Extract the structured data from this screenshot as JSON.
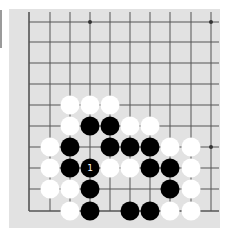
{
  "board": {
    "background": "#e2e2e2",
    "line_color": "#555555",
    "columns_x": [
      29,
      50,
      70,
      90,
      110,
      130,
      150,
      170,
      191,
      211
    ],
    "rows_y": [
      22,
      42,
      63,
      84,
      105,
      126,
      147,
      168,
      189,
      211
    ],
    "edges": {
      "left": true,
      "bottom": true,
      "top": false,
      "right": false
    },
    "star_points": [
      {
        "col": 3,
        "row": 0
      },
      {
        "col": 9,
        "row": 0
      },
      {
        "col": 9,
        "row": 6
      }
    ],
    "stones": [
      {
        "col": 2,
        "row": 4,
        "color": "white"
      },
      {
        "col": 3,
        "row": 4,
        "color": "white"
      },
      {
        "col": 4,
        "row": 4,
        "color": "white"
      },
      {
        "col": 2,
        "row": 5,
        "color": "white"
      },
      {
        "col": 3,
        "row": 5,
        "color": "black"
      },
      {
        "col": 4,
        "row": 5,
        "color": "black"
      },
      {
        "col": 5,
        "row": 5,
        "color": "white"
      },
      {
        "col": 6,
        "row": 5,
        "color": "white"
      },
      {
        "col": 1,
        "row": 6,
        "color": "white"
      },
      {
        "col": 2,
        "row": 6,
        "color": "black"
      },
      {
        "col": 4,
        "row": 6,
        "color": "black"
      },
      {
        "col": 5,
        "row": 6,
        "color": "black"
      },
      {
        "col": 6,
        "row": 6,
        "color": "black"
      },
      {
        "col": 7,
        "row": 6,
        "color": "white"
      },
      {
        "col": 8,
        "row": 6,
        "color": "white"
      },
      {
        "col": 1,
        "row": 7,
        "color": "white"
      },
      {
        "col": 2,
        "row": 7,
        "color": "black"
      },
      {
        "col": 3,
        "row": 7,
        "color": "black",
        "label": "1"
      },
      {
        "col": 4,
        "row": 7,
        "color": "white"
      },
      {
        "col": 5,
        "row": 7,
        "color": "white"
      },
      {
        "col": 6,
        "row": 7,
        "color": "black"
      },
      {
        "col": 7,
        "row": 7,
        "color": "black"
      },
      {
        "col": 8,
        "row": 7,
        "color": "white"
      },
      {
        "col": 1,
        "row": 8,
        "color": "white"
      },
      {
        "col": 2,
        "row": 8,
        "color": "white"
      },
      {
        "col": 3,
        "row": 8,
        "color": "black"
      },
      {
        "col": 7,
        "row": 8,
        "color": "black"
      },
      {
        "col": 8,
        "row": 8,
        "color": "white"
      },
      {
        "col": 2,
        "row": 9,
        "color": "white"
      },
      {
        "col": 3,
        "row": 9,
        "color": "black"
      },
      {
        "col": 5,
        "row": 9,
        "color": "black"
      },
      {
        "col": 6,
        "row": 9,
        "color": "black"
      },
      {
        "col": 7,
        "row": 9,
        "color": "white"
      },
      {
        "col": 8,
        "row": 9,
        "color": "white"
      }
    ]
  }
}
